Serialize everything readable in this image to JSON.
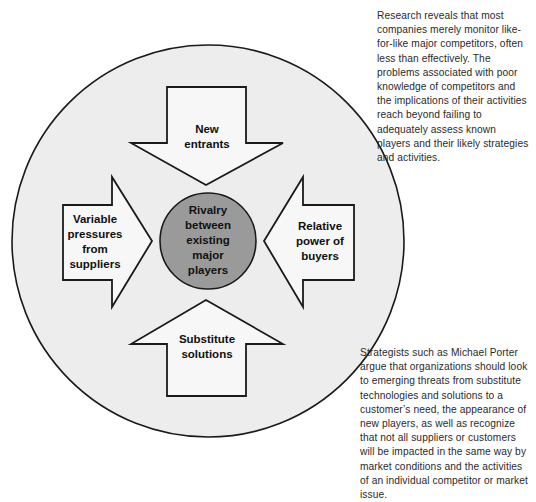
{
  "figure": {
    "type": "porter-five-forces-diagram",
    "outer_circle": {
      "name": "industry-environment-circle",
      "fill": "#ededed",
      "stroke": "#1a1a1a"
    },
    "center": {
      "name": "rivalry-core",
      "fill": "#9a9a9a",
      "stroke": "#1a1a1a",
      "lines": [
        "Rivalry",
        "between",
        "existing",
        "major",
        "players"
      ]
    },
    "forces": [
      {
        "id": "new-entrants",
        "direction": "down",
        "lines": [
          "New",
          "entrants"
        ]
      },
      {
        "id": "variable-pressures-from-suppliers",
        "direction": "right",
        "lines": [
          "Variable",
          "pressures",
          "from",
          "suppliers"
        ]
      },
      {
        "id": "relative-power-of-buyers",
        "direction": "left",
        "lines": [
          "Relative",
          "power of",
          "buyers"
        ]
      },
      {
        "id": "substitute-solutions",
        "direction": "up",
        "lines": [
          "Substitute",
          "solutions"
        ]
      }
    ]
  },
  "annotations": {
    "top": "Research reveals that most companies merely monitor like-for-like major competitors, often less than effectively. The problems associated with poor knowledge of competitors and the implications of their activities reach beyond failing to adequately assess known players and their likely strategies and activities.",
    "bottom": "Strategists such as Michael Porter argue that organizations should look to emerging threats from substitute technologies and solutions to a customer’s need, the appearance of new players, as well as recognize that not all suppliers or customers will be impacted in the same way by market conditions and the activities of an individual competitor or market issue."
  }
}
